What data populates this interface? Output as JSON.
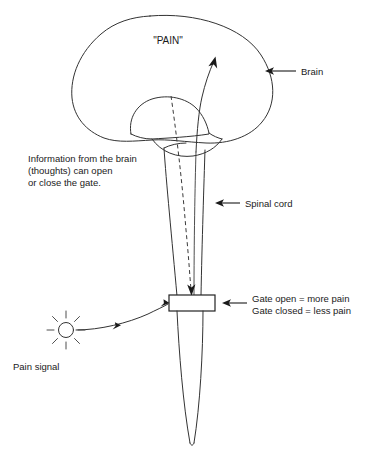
{
  "figure": {
    "background_color": "#ffffff",
    "line_color": "#333333",
    "text_color": "#1a1a1a"
  },
  "labels": {
    "pain_in_brain": "\"PAIN\"",
    "brain": "Brain",
    "spinal_cord": "Spinal cord",
    "pain_signal": "Pain signal",
    "thoughts_line_1": "Information from the brain",
    "thoughts_line_2": "(thoughts) can open",
    "thoughts_line_3": "or close the gate.",
    "gate_open": "Gate open = more pain",
    "gate_closed": "Gate closed = less pain"
  },
  "parts": [
    {
      "id": "brain",
      "name": "Brain",
      "label": "Brain"
    },
    {
      "id": "spinal-cord",
      "name": "Spinal cord",
      "label": "Spinal cord"
    },
    {
      "id": "gate",
      "name": "Gate",
      "label": "Gate open = more pain"
    },
    {
      "id": "pain-signal",
      "name": "Pain signal",
      "label": "Pain signal"
    }
  ],
  "pathways": [
    {
      "id": "ascending",
      "name": "Ascending pain pathway",
      "style": "solid",
      "direction": "upward to brain"
    },
    {
      "id": "descending",
      "name": "Descending modulation from brain",
      "style": "dashed",
      "direction": "downward to gate"
    },
    {
      "id": "afferent",
      "name": "Incoming pain signal to gate",
      "style": "solid",
      "direction": "rightward to gate"
    }
  ]
}
